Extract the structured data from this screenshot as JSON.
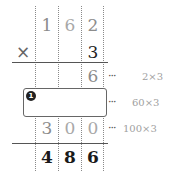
{
  "multiplicand": [
    "1",
    "6",
    "2"
  ],
  "operator": "×",
  "multiplier": "3",
  "partial_rows": [
    {
      "digits": [
        "",
        "",
        "6"
      ],
      "note": "2×3"
    },
    {
      "digits": [
        "",
        "",
        ""
      ],
      "note": "60×3",
      "blank_box": true,
      "badge": "1"
    },
    {
      "digits": [
        "3",
        "0",
        "0"
      ],
      "note": "100×3"
    }
  ],
  "result": [
    "4",
    "8",
    "6"
  ],
  "ellipsis": "···"
}
